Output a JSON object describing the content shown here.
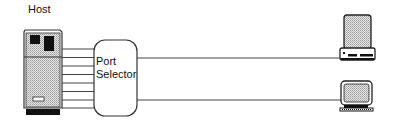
{
  "diagram": {
    "host": {
      "label": "Host"
    },
    "port_selector": {
      "label_line1": "Port",
      "label_line2": "Selector"
    },
    "host_to_selector_lines": 8,
    "terminals": [
      {
        "type": "desktop-terminal"
      },
      {
        "type": "monitor-terminal"
      }
    ],
    "colors": {
      "stroke": "#333333",
      "fill_pattern": "#c8c8c8",
      "dark": "#111111"
    }
  }
}
